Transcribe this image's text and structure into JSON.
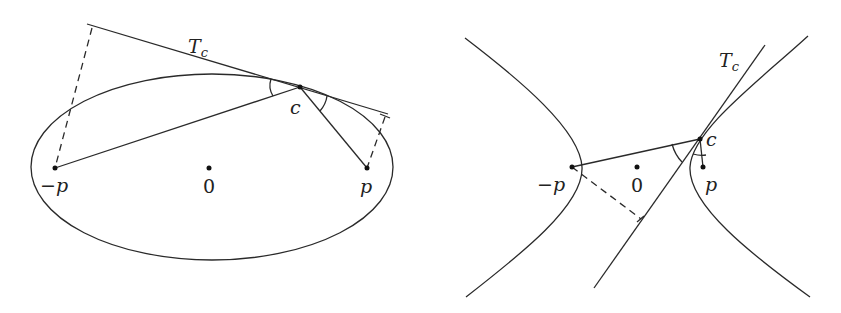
{
  "figures": [
    {
      "name": "ellipse-figure",
      "labels": {
        "tangent": "T",
        "tangent_sub": "c",
        "point_c": "c",
        "minus_p": "−p",
        "origin": "0",
        "p": "p"
      }
    },
    {
      "name": "hyperbola-figure",
      "labels": {
        "tangent": "T",
        "tangent_sub": "c",
        "point_c": "c",
        "minus_p": "−p",
        "origin": "0",
        "p": "p"
      }
    }
  ],
  "colors": {
    "stroke": "#2a2a2a",
    "background": "#ffffff"
  }
}
